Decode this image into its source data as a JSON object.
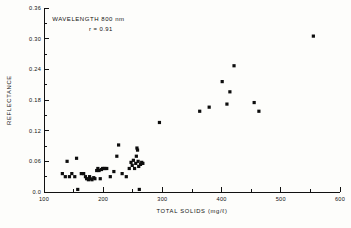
{
  "chart_data": {
    "type": "scatter",
    "title": "",
    "xlabel": "TOTAL SOLIDS (mg/ℓ)",
    "ylabel": "REFLECTANCE",
    "xlim": [
      100,
      600
    ],
    "ylim": [
      0.0,
      0.36
    ],
    "xticks": [
      100,
      200,
      300,
      400,
      500,
      600
    ],
    "xticklabels": [
      "100",
      "200",
      "300",
      "400",
      "500",
      "600"
    ],
    "yticks": [
      0.0,
      0.06,
      0.12,
      0.18,
      0.24,
      0.3,
      0.36
    ],
    "yticklabels": [
      "0.0",
      "0.06",
      "0.12",
      "0.18",
      "0.24",
      "0.30",
      "0.36"
    ],
    "xminorticks": [
      150,
      250,
      350,
      450,
      550
    ],
    "yminorticks": [
      0.03,
      0.09,
      0.15,
      0.21,
      0.27,
      0.33
    ],
    "grid": false,
    "legend": null,
    "marker": "filled-square",
    "marker_color": "#0d0d0d",
    "annotations": [
      {
        "text": "WAVELENGTH 800 nm",
        "x": 175,
        "y": 0.335
      },
      {
        "text": "r = 0.91",
        "x": 196,
        "y": 0.315
      }
    ],
    "series": [
      {
        "name": "Reflectance vs Total Solids at 800 nm",
        "points": [
          [
            131,
            0.036
          ],
          [
            136,
            0.03
          ],
          [
            139,
            0.06
          ],
          [
            143,
            0.03
          ],
          [
            147,
            0.036
          ],
          [
            152,
            0.03
          ],
          [
            155,
            0.066
          ],
          [
            157,
            0.005
          ],
          [
            163,
            0.036
          ],
          [
            167,
            0.036
          ],
          [
            170,
            0.03
          ],
          [
            172,
            0.026
          ],
          [
            175,
            0.024
          ],
          [
            177,
            0.03
          ],
          [
            178,
            0.026
          ],
          [
            181,
            0.024
          ],
          [
            184,
            0.028
          ],
          [
            186,
            0.026
          ],
          [
            189,
            0.042
          ],
          [
            191,
            0.046
          ],
          [
            193,
            0.042
          ],
          [
            195,
            0.026
          ],
          [
            197,
            0.044
          ],
          [
            199,
            0.046
          ],
          [
            201,
            0.046
          ],
          [
            203,
            0.046
          ],
          [
            206,
            0.046
          ],
          [
            212,
            0.03
          ],
          [
            218,
            0.04
          ],
          [
            223,
            0.07
          ],
          [
            226,
            0.092
          ],
          [
            232,
            0.036
          ],
          [
            239,
            0.03
          ],
          [
            244,
            0.046
          ],
          [
            247,
            0.058
          ],
          [
            249,
            0.052
          ],
          [
            251,
            0.062
          ],
          [
            253,
            0.046
          ],
          [
            255,
            0.056
          ],
          [
            256,
            0.07
          ],
          [
            257,
            0.086
          ],
          [
            258,
            0.082
          ],
          [
            259,
            0.06
          ],
          [
            260,
            0.05
          ],
          [
            261,
            0.005
          ],
          [
            263,
            0.054
          ],
          [
            265,
            0.058
          ],
          [
            267,
            0.056
          ],
          [
            295,
            0.136
          ],
          [
            363,
            0.158
          ],
          [
            379,
            0.166
          ],
          [
            401,
            0.216
          ],
          [
            409,
            0.172
          ],
          [
            414,
            0.196
          ],
          [
            421,
            0.247
          ],
          [
            455,
            0.175
          ],
          [
            463,
            0.158
          ],
          [
            555,
            0.305
          ]
        ]
      }
    ]
  },
  "axis_titles": {
    "x": "TOTAL SOLIDS (mg/ℓ)",
    "y": "REFLECTANCE"
  }
}
